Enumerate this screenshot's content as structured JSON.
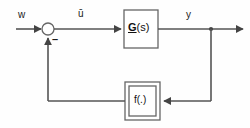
{
  "diagram": {
    "kind": "control-system-block-diagram",
    "background_color": "#fefefe",
    "line_color": "#555555",
    "text_color": "#1a1a1a",
    "signals": {
      "input_label": "w",
      "control_label": "ū",
      "output_label": "y",
      "feedback_sign": "–"
    },
    "blocks": [
      {
        "name": "plant",
        "label": "G(s)",
        "label_prefix": "G",
        "label_suffix": "(s)",
        "style": "single-border",
        "x": 124,
        "y": 10,
        "width": 34,
        "height": 38
      },
      {
        "name": "nonlinear-feedback",
        "label": "f(.)",
        "style": "double-border",
        "x": 125,
        "y": 82,
        "width": 35,
        "height": 38
      }
    ],
    "summing_junction": {
      "name": "summing-junction",
      "cx": 48,
      "cy": 29,
      "r": 6,
      "fill": "#ffffff"
    },
    "output_junction": {
      "name": "output-branch-node",
      "cx": 211,
      "cy": 29,
      "r": 2
    },
    "wires": [
      {
        "name": "input-wire",
        "from": "w",
        "to": "summing-junction"
      },
      {
        "name": "control-wire",
        "from": "summing-junction",
        "to": "plant"
      },
      {
        "name": "output-wire",
        "from": "plant",
        "to": "output-arrow"
      },
      {
        "name": "branch-down-wire",
        "from": "output-branch-node",
        "to": "nonlinear-feedback"
      },
      {
        "name": "feedback-return-wire",
        "from": "nonlinear-feedback",
        "to": "summing-junction"
      }
    ]
  }
}
